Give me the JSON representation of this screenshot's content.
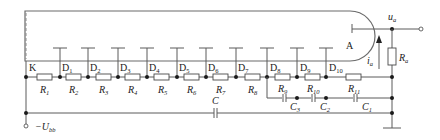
{
  "diagram": {
    "type": "circuit-schematic",
    "cathode_label": "K",
    "anode_label": "A",
    "dynodes": [
      {
        "label": "D",
        "sub": "1"
      },
      {
        "label": "D",
        "sub": "2"
      },
      {
        "label": "D",
        "sub": "3"
      },
      {
        "label": "D",
        "sub": "4"
      },
      {
        "label": "D",
        "sub": "5"
      },
      {
        "label": "D",
        "sub": "6"
      },
      {
        "label": "D",
        "sub": "7"
      },
      {
        "label": "D",
        "sub": "8"
      },
      {
        "label": "D",
        "sub": "9"
      },
      {
        "label": "D",
        "sub": "10"
      }
    ],
    "resistors": [
      {
        "label": "R",
        "sub": "1"
      },
      {
        "label": "R",
        "sub": "2"
      },
      {
        "label": "R",
        "sub": "3"
      },
      {
        "label": "R",
        "sub": "4"
      },
      {
        "label": "R",
        "sub": "5"
      },
      {
        "label": "R",
        "sub": "6"
      },
      {
        "label": "R",
        "sub": "7"
      },
      {
        "label": "R",
        "sub": "8"
      },
      {
        "label": "R",
        "sub": "9"
      },
      {
        "label": "R",
        "sub": "10"
      },
      {
        "label": "R",
        "sub": "11"
      }
    ],
    "load_resistor": {
      "label": "R",
      "sub": "a"
    },
    "capacitors": [
      {
        "label": "C",
        "sub": ""
      },
      {
        "label": "C",
        "sub": "3"
      },
      {
        "label": "C",
        "sub": "2"
      },
      {
        "label": "C",
        "sub": "1"
      }
    ],
    "output_voltage": {
      "label": "u",
      "sub": "a"
    },
    "anode_current": {
      "label": "i",
      "sub": "a"
    },
    "supply": {
      "label": "−U",
      "sub": "bb"
    }
  }
}
